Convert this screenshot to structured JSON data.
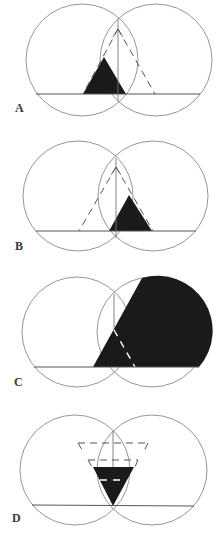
{
  "figure": {
    "panels": [
      {
        "label": "A",
        "description": "Black triangle left of midline; dashed cone from arrow apex"
      },
      {
        "label": "B",
        "description": "Black triangle right of midline; dashed cone from arrow apex"
      },
      {
        "label": "C",
        "description": "Large black region filling most of right circle with white dashed edges"
      },
      {
        "label": "D",
        "description": "Inverted black triangle at center with two dashed trapezoids above"
      }
    ],
    "colors": {
      "fill": "#1a1a1a",
      "stroke": "#555555",
      "circle": "#8a8a8a",
      "background": "#ffffff"
    }
  }
}
